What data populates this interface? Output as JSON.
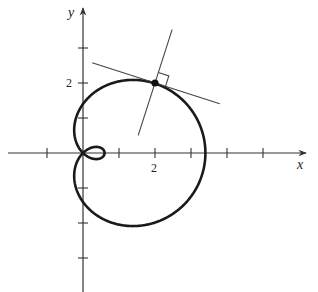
{
  "figure": {
    "type": "polar-curve",
    "curve": "limacon",
    "equation_hint": "r = 1.4 + 2 cos(theta)",
    "params": {
      "a": 1.4,
      "b": 2
    },
    "axes": {
      "x_label": "x",
      "y_label": "y",
      "x_ticks": [
        -1,
        1,
        2,
        3,
        4,
        5
      ],
      "y_ticks": [
        -3,
        -2,
        -1,
        1,
        2,
        3
      ],
      "x_tick_label": "2",
      "y_tick_label": "2"
    },
    "point": {
      "x": 2,
      "y": 2
    },
    "tangent_slope": -0.33,
    "normal_slope": 3.0,
    "right_angle_marker": true,
    "colors": {
      "curve": "#1a1a1a",
      "axes": "#333333",
      "lines": "#444444"
    }
  },
  "layout": {
    "origin_px": [
      83,
      153
    ],
    "unit_x_px": 36,
    "unit_y_px": 35
  }
}
